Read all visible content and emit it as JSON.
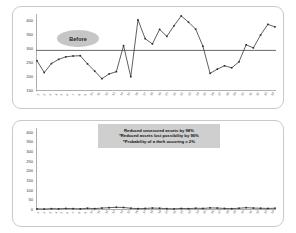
{
  "panels": {
    "before": {
      "bubble_label": "Before"
    },
    "after": {
      "bubble_label": "After"
    }
  },
  "callout": {
    "lines": [
      "Reduced unsecured assets by 98%",
      "*Reduced assets lost possibility by 96%",
      "*Probability of a theft occuring = 2%"
    ]
  },
  "chart_data": [
    {
      "type": "line",
      "title": "Before",
      "xlabel": "",
      "ylabel": "",
      "ylim": [
        150,
        425
      ],
      "yticks": [
        150,
        200,
        250,
        300,
        350,
        400
      ],
      "grid": false,
      "legend": "none",
      "reference_line": {
        "value": 295,
        "color": "#6b6b6b",
        "label": ""
      },
      "categories": [
        "1",
        "2",
        "3",
        "4",
        "5",
        "6",
        "7",
        "8",
        "9",
        "10",
        "11",
        "12",
        "13",
        "14",
        "15",
        "16",
        "17",
        "18",
        "19",
        "20",
        "21",
        "22",
        "23",
        "24",
        "25",
        "26",
        "27",
        "28",
        "29",
        "30",
        "31",
        "32",
        "33",
        "34"
      ],
      "series": [
        {
          "name": "Unsecured assets",
          "color": "#2b2b2b",
          "marker": "square",
          "values": [
            258,
            216,
            248,
            263,
            272,
            275,
            276,
            247,
            221,
            194,
            211,
            219,
            312,
            201,
            404,
            337,
            318,
            370,
            345,
            383,
            418,
            396,
            371,
            310,
            213,
            228,
            240,
            233,
            254,
            315,
            304,
            350,
            388,
            379
          ]
        }
      ]
    },
    {
      "type": "line",
      "title": "After",
      "xlabel": "",
      "ylabel": "",
      "ylim": [
        0,
        425
      ],
      "yticks": [
        0,
        50,
        100,
        150,
        200,
        250,
        300,
        350,
        400
      ],
      "grid": false,
      "legend": "none",
      "categories": [
        "1",
        "2",
        "3",
        "4",
        "5",
        "6",
        "7",
        "8",
        "9",
        "10",
        "11",
        "12",
        "13",
        "14",
        "15",
        "16",
        "17",
        "18",
        "19",
        "20",
        "21",
        "22",
        "23",
        "24",
        "25",
        "26",
        "27",
        "28",
        "29",
        "30",
        "31",
        "32",
        "33",
        "34"
      ],
      "series": [
        {
          "name": "Unsecured assets",
          "color": "#2b2b2b",
          "marker": "square",
          "values": [
            6,
            5,
            7,
            6,
            8,
            7,
            6,
            9,
            7,
            10,
            12,
            14,
            13,
            9,
            7,
            8,
            10,
            9,
            7,
            6,
            8,
            7,
            9,
            8,
            11,
            10,
            8,
            7,
            9,
            12,
            10,
            9,
            8,
            9
          ]
        }
      ]
    }
  ]
}
